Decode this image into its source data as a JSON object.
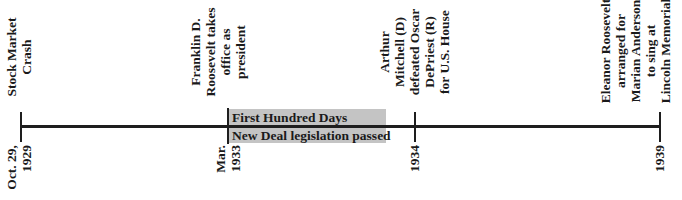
{
  "timeline": {
    "events": [
      {
        "date_lines": [
          "Oct. 29,",
          "1929"
        ],
        "label_lines": [
          "Stock Market",
          "Crash"
        ]
      },
      {
        "date_lines": [
          "Mar.",
          "1933"
        ],
        "label_lines": [
          "Franklin D.",
          "Roosevelt takes",
          "office as",
          "president"
        ]
      },
      {
        "date_lines": [
          "1934"
        ],
        "label_lines": [
          "Arthur",
          "Mitchell (D)",
          "defeated Oscar",
          "DePriest (R)",
          "for U.S. House"
        ]
      },
      {
        "date_lines": [
          "1939"
        ],
        "label_lines": [
          "Eleanor Roosevelt",
          "arranged for",
          "Marian Anderson",
          "to sing at",
          "Lincoln Memorial"
        ]
      }
    ],
    "span": {
      "line1": "First Hundred Days",
      "line2": "New Deal legislation passed",
      "color": "#c4c4c4"
    },
    "line_color": "#1e1e1e"
  }
}
